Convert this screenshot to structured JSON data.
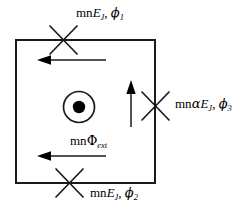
{
  "figure": {
    "type": "circuit-diagram",
    "name": "flux-qubit-squid-loop",
    "background_color": "#ffffff",
    "stroke_color": "#1a1a1a"
  },
  "labels": {
    "top_junction": {
      "name": "junction-1-label",
      "prefix": "mn",
      "energy": "E",
      "energy_sub": "J",
      "separator": ", ",
      "phase": "ϕ",
      "phase_sub": "1",
      "plain": "mnE_J, ϕ_1"
    },
    "right_junction": {
      "name": "junction-3-label",
      "prefix": "mn",
      "alpha": "α",
      "energy": "E",
      "energy_sub": "J",
      "separator": ", ",
      "phase": "ϕ",
      "phase_sub": "3",
      "plain": "mnαE_J, ϕ_3"
    },
    "bottom_junction": {
      "name": "junction-2-label",
      "prefix": "mn",
      "energy": "E",
      "energy_sub": "J",
      "separator": ", ",
      "phase": "ϕ",
      "phase_sub": "2",
      "plain": "mnE_J, ϕ_2"
    },
    "flux": {
      "name": "external-flux-label",
      "prefix": "mn",
      "symbol": "Φ",
      "symbol_sub": "ext",
      "plain": "mnΦ_ext"
    }
  },
  "geometry": {
    "loop": {
      "x": 16,
      "y": 40,
      "width": 139,
      "height": 143,
      "stroke_width": 2
    },
    "junctions": [
      {
        "name": "josephson-junction-top",
        "cx": 63,
        "cy": 40,
        "arm": 17,
        "stroke_width": 1.6
      },
      {
        "name": "josephson-junction-right",
        "cx": 155,
        "cy": 106,
        "arm": 17,
        "stroke_width": 1.6
      },
      {
        "name": "josephson-junction-bottom",
        "cx": 69,
        "cy": 183,
        "arm": 17,
        "stroke_width": 1.6
      }
    ],
    "flux_symbol": {
      "name": "flux-out-of-page-symbol",
      "cx": 79,
      "cy": 107,
      "outer_r": 15,
      "inner_r": 6
    },
    "current_arrows": [
      {
        "name": "current-arrow-upper",
        "x1": 105,
        "y1": 60,
        "x2": 38,
        "y2": 60,
        "direction": "left"
      },
      {
        "name": "current-arrow-lower",
        "x1": 105,
        "y1": 156,
        "x2": 38,
        "y2": 156,
        "direction": "left"
      },
      {
        "name": "current-arrow-vertical",
        "x1": 131,
        "y1": 126,
        "x2": 131,
        "y2": 82,
        "direction": "up"
      }
    ]
  }
}
